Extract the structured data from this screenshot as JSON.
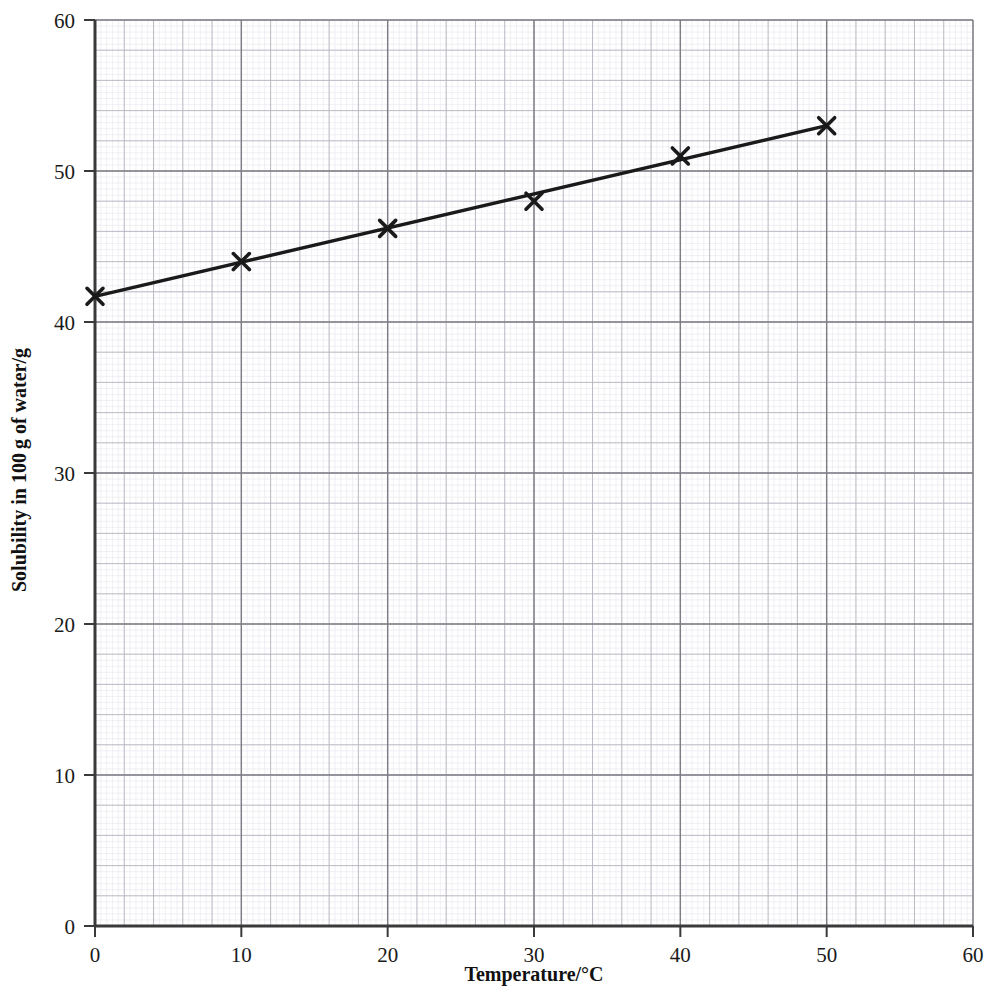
{
  "chart_data": {
    "type": "line",
    "title": "",
    "subtitle": "",
    "xlabel": "Temperature/°C",
    "ylabel": "Solubility in 100 g of water/g",
    "xlim": [
      0,
      60
    ],
    "ylim": [
      0,
      60
    ],
    "xticks": [
      "0",
      "10",
      "20",
      "30",
      "40",
      "50",
      "60"
    ],
    "xtick_values": [
      0,
      10,
      20,
      30,
      40,
      50,
      60
    ],
    "yticks": [
      "0",
      "10",
      "20",
      "30",
      "40",
      "50",
      "60"
    ],
    "ytick_values": [
      0,
      10,
      20,
      30,
      40,
      50,
      60
    ],
    "grid": "graph-paper: major gridlines every 10 units, medium gridlines every 2 units, fine gridlines every 0.4 units",
    "legend": "none",
    "marker": "x-cross",
    "line_style": "solid best-fit straight line through points",
    "series": [
      {
        "name": "Solubility",
        "x": [
          0,
          10,
          20,
          30,
          40,
          50
        ],
        "values": [
          41.7,
          44.0,
          46.2,
          48.0,
          51.0,
          53.0
        ]
      }
    ],
    "fit_line": {
      "from": [
        0,
        41.7
      ],
      "to": [
        50,
        53.0
      ]
    },
    "colors": {
      "data_line": "#1a1a1a",
      "marker": "#1a1a1a",
      "axis": "#3a3a3a",
      "major_grid": "#808080",
      "medium_grid": "#b9b9c2",
      "fine_grid": "#e2e2ea",
      "background": "#ffffff",
      "text": "#1a1a1a"
    }
  }
}
